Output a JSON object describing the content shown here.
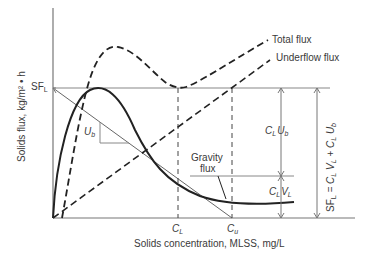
{
  "diagram": {
    "type": "solids-flux-curve",
    "axes": {
      "y_label": "Solids flux, kg/m² • h",
      "x_label": "Solids concentration, MLSS,  mg/L"
    },
    "legend": {
      "total_flux": "Total flux",
      "underflow_flux": "Underflow flux",
      "gravity_flux_line1": "Gravity",
      "gravity_flux_line2": "flux"
    },
    "labels": {
      "sfl_main": "SF",
      "sfl_sub": "L",
      "ub_main": "U",
      "ub_sub": "b",
      "cl_main": "C",
      "cl_sub": "L",
      "cu_main": "C",
      "cu_sub": "u",
      "club": "C",
      "club_sub1": "L",
      "club_u": "U",
      "club_sub2": "b",
      "clvl": "C",
      "clvl_sub1": "L",
      "clvl_v": "V",
      "clvl_sub2": "L",
      "equation": "SF",
      "equation_sub": "L",
      "equation_rest1": " = C",
      "equation_sub2": "L",
      "equation_rest2": " V",
      "equation_sub3": "L",
      "equation_rest3": " + C",
      "equation_sub4": "L",
      "equation_rest4": " U",
      "equation_sub5": "b"
    },
    "colors": {
      "curve": "#222222",
      "axis": "#666666",
      "text": "#3a3a3a"
    }
  }
}
